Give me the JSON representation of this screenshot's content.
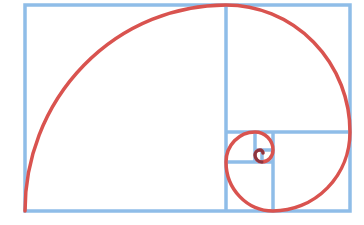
{
  "diagram": {
    "colors": {
      "grid": "#8fbde8",
      "spiral": "#d9534f",
      "spiral_dark": "#6b2a3a",
      "background": "#ffffff"
    },
    "outer_rect": {
      "x": 25,
      "y": 5,
      "width": 325,
      "height": 206
    }
  }
}
